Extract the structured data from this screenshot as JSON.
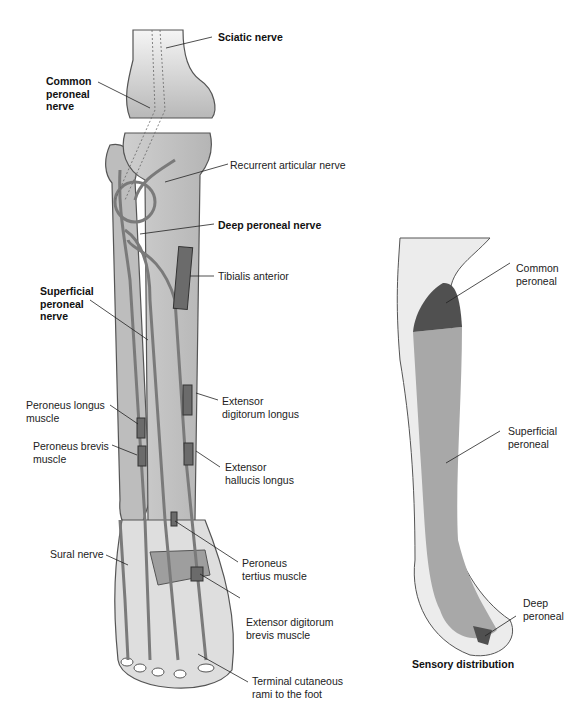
{
  "main_figure": {
    "labels": {
      "sciatic": "Sciatic nerve",
      "common": "Common\nperoneal\nnerve",
      "recurrent": "Recurrent articular nerve",
      "deep": "Deep peroneal nerve",
      "tibialis": "Tibialis anterior",
      "superficial": "Superficial\nperoneal\nnerve",
      "per_longus": "Peroneus longus\nmuscle",
      "ext_dig_longus": "Extensor\ndigitorum longus",
      "per_brevis": "Peroneus brevis\nmuscle",
      "ext_hall": "Extensor\nhallucis longus",
      "sural": "Sural nerve",
      "per_tertius": "Peroneus\ntertius muscle",
      "ext_dig_brevis": "Extensor digitorum\nbrevis muscle",
      "terminal": "Terminal cutaneous\nrami to the foot"
    }
  },
  "sensory_figure": {
    "title": "Sensory distribution",
    "labels": {
      "common": "Common\nperoneal",
      "superficial": "Superficial\nperoneal",
      "deep": "Deep\nperoneal"
    },
    "colors": {
      "common": "#505050",
      "superficial": "#a8a8a8",
      "deep": "#505050",
      "skin": "#e6e6e6"
    }
  }
}
